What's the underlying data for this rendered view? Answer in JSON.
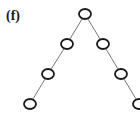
{
  "figure": {
    "label": "(f)",
    "colors": {
      "node_stroke": "#1a1a1a",
      "edge": "#777777",
      "background": "#ffffff"
    },
    "node_radius": 6,
    "nodes": [
      {
        "id": "root",
        "x": 85,
        "y": 14
      },
      {
        "id": "l1",
        "x": 67,
        "y": 44
      },
      {
        "id": "r1",
        "x": 103,
        "y": 44
      },
      {
        "id": "l2",
        "x": 48,
        "y": 74
      },
      {
        "id": "r2",
        "x": 121,
        "y": 74
      },
      {
        "id": "l3",
        "x": 30,
        "y": 104
      },
      {
        "id": "r3",
        "x": 139,
        "y": 104
      }
    ],
    "edges": [
      [
        "root",
        "l1"
      ],
      [
        "root",
        "r1"
      ],
      [
        "l1",
        "l2"
      ],
      [
        "r1",
        "r2"
      ],
      [
        "l2",
        "l3"
      ],
      [
        "r2",
        "r3"
      ]
    ]
  }
}
